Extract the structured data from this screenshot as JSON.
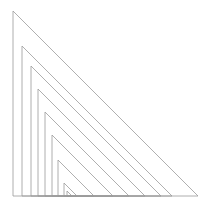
{
  "figure": {
    "name": "nested-right-triangles",
    "background_color": "#ffffff",
    "stroke_color": "#9a9a9a",
    "stroke_width": 0.8,
    "canvas": {
      "width": 216,
      "height": 207
    }
  },
  "chart_data": {
    "type": "line",
    "xlabel": "",
    "ylabel": "",
    "grid": false,
    "legend": null,
    "xlim": [
      0,
      216
    ],
    "ylim": [
      0,
      207
    ],
    "baseline_y": 196,
    "count": 9,
    "series": [
      {
        "name": "triangle-1",
        "apex": [
          13,
          11
        ],
        "right_angle": [
          13,
          196
        ],
        "base_end": [
          198,
          196
        ],
        "leg_height": 185,
        "base_length": 185
      },
      {
        "name": "triangle-2",
        "apex": [
          22,
          46
        ],
        "right_angle": [
          22,
          196
        ],
        "base_end": [
          172,
          196
        ],
        "leg_height": 150,
        "base_length": 150
      },
      {
        "name": "triangle-3",
        "apex": [
          31,
          66
        ],
        "right_angle": [
          31,
          196
        ],
        "base_end": [
          161,
          196
        ],
        "leg_height": 130,
        "base_length": 130
      },
      {
        "name": "triangle-4",
        "apex": [
          38,
          89
        ],
        "right_angle": [
          38,
          196
        ],
        "base_end": [
          145,
          196
        ],
        "leg_height": 107,
        "base_length": 107
      },
      {
        "name": "triangle-5",
        "apex": [
          45,
          112
        ],
        "right_angle": [
          45,
          196
        ],
        "base_end": [
          129,
          196
        ],
        "leg_height": 84,
        "base_length": 84
      },
      {
        "name": "triangle-6",
        "apex": [
          52,
          135
        ],
        "right_angle": [
          52,
          196
        ],
        "base_end": [
          113,
          196
        ],
        "leg_height": 61,
        "base_length": 61
      },
      {
        "name": "triangle-7",
        "apex": [
          58,
          160
        ],
        "right_angle": [
          58,
          196
        ],
        "base_end": [
          94,
          196
        ],
        "leg_height": 36,
        "base_length": 36
      },
      {
        "name": "triangle-8",
        "apex": [
          64,
          183
        ],
        "right_angle": [
          64,
          196
        ],
        "base_end": [
          77,
          196
        ],
        "leg_height": 13,
        "base_length": 13
      },
      {
        "name": "triangle-9",
        "apex": [
          67,
          191
        ],
        "right_angle": [
          67,
          196
        ],
        "base_end": [
          72,
          196
        ],
        "leg_height": 5,
        "base_length": 5
      }
    ]
  }
}
